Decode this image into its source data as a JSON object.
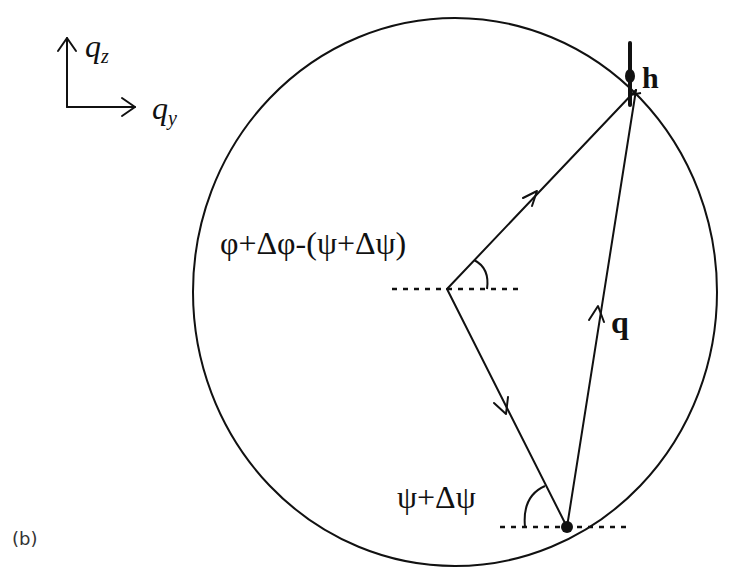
{
  "figure": {
    "panel_label": "(b)",
    "axes_legend": {
      "vertical_axis": {
        "symbol": "q",
        "subscript": "z"
      },
      "horizontal_axis": {
        "symbol": "q",
        "subscript": "y"
      }
    },
    "labels": {
      "top_point": "h",
      "chord_vector": "q",
      "center_angle": "φ+Δφ-(ψ+Δψ)",
      "bottom_angle": "ψ+Δψ"
    },
    "colors": {
      "line": "#111111",
      "background": "#ffffff"
    }
  }
}
